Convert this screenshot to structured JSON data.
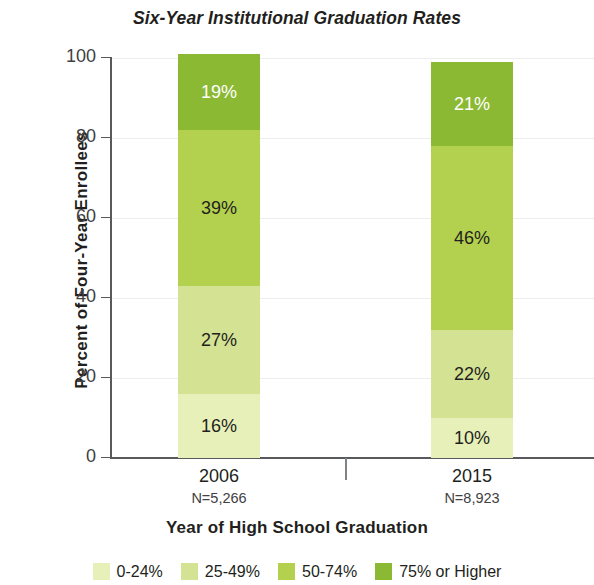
{
  "chart_data": {
    "type": "bar",
    "subtype": "stacked-100-percent",
    "title": "Six-Year Institutional Graduation Rates",
    "xlabel": "Year of High School Graduation",
    "ylabel": "Percent of Four-Year Enrollees",
    "ylim": [
      0,
      100
    ],
    "yticks": [
      0,
      20,
      40,
      60,
      80,
      100
    ],
    "ytick_labels": [
      "0",
      "20",
      "40",
      "60",
      "80",
      "100"
    ],
    "grid": true,
    "legend_position": "bottom",
    "categories": [
      "2006",
      "2015"
    ],
    "category_sublabels": [
      "N=5,266",
      "N=8,923"
    ],
    "series": [
      {
        "name": "0-24%",
        "color": "#e8f0b9",
        "label_color": "#231f20",
        "values": [
          16,
          10
        ],
        "value_labels": [
          "16%",
          "10%"
        ]
      },
      {
        "name": "25-49%",
        "color": "#d4e293",
        "label_color": "#231f20",
        "values": [
          27,
          22
        ],
        "value_labels": [
          "27%",
          "22%"
        ]
      },
      {
        "name": "50-74%",
        "color": "#b3d14f",
        "label_color": "#231f20",
        "values": [
          39,
          46
        ],
        "value_labels": [
          "39%",
          "46%"
        ]
      },
      {
        "name": "75% or Higher",
        "color": "#8cb933",
        "label_color": "#ffffff",
        "values": [
          19,
          21
        ],
        "value_labels": [
          "19%",
          "21%"
        ]
      }
    ],
    "legend": [
      {
        "label": "0-24%",
        "color": "#e8f0b9"
      },
      {
        "label": "25-49%",
        "color": "#d4e293"
      },
      {
        "label": "50-74%",
        "color": "#b3d14f"
      },
      {
        "label": "75% or Higher",
        "color": "#8cb933"
      }
    ],
    "axis_color": "#58595b",
    "grid_color": "#ededee",
    "text_color": "#231f20"
  }
}
